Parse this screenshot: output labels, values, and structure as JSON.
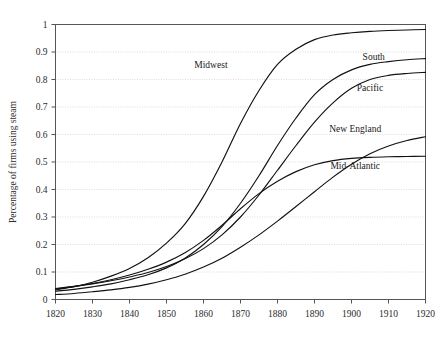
{
  "chart_data": {
    "type": "line",
    "title": "",
    "xlabel": "",
    "ylabel": "Percentage of firms using steam",
    "xlim": [
      1820,
      1920
    ],
    "ylim": [
      0,
      1
    ],
    "grid": true,
    "legend_position": "inline-labels",
    "x_ticks": [
      "1820",
      "1830",
      "1840",
      "1850",
      "1860",
      "1870",
      "1880",
      "1890",
      "1900",
      "1910",
      "1920"
    ],
    "y_ticks": [
      "0",
      "0.1",
      "0.2",
      "0.3",
      "0.4",
      "0.5",
      "0.6",
      "0.7",
      "0.8",
      "0.9",
      "1"
    ],
    "x": [
      1820,
      1825,
      1830,
      1835,
      1840,
      1845,
      1850,
      1855,
      1860,
      1865,
      1870,
      1875,
      1880,
      1885,
      1890,
      1895,
      1900,
      1905,
      1910,
      1915,
      1920
    ],
    "series": [
      {
        "name": "Midwest",
        "label": "Midwest",
        "label_x": 1862,
        "label_y": 0.855,
        "values": [
          0.035,
          0.047,
          0.063,
          0.085,
          0.113,
          0.152,
          0.205,
          0.275,
          0.375,
          0.5,
          0.64,
          0.76,
          0.855,
          0.91,
          0.945,
          0.962,
          0.97,
          0.975,
          0.978,
          0.98,
          0.982
        ]
      },
      {
        "name": "South",
        "label": "South",
        "label_x": 1906,
        "label_y": 0.885,
        "values": [
          0.03,
          0.037,
          0.046,
          0.057,
          0.072,
          0.09,
          0.115,
          0.15,
          0.2,
          0.265,
          0.35,
          0.45,
          0.56,
          0.66,
          0.745,
          0.8,
          0.835,
          0.855,
          0.865,
          0.872,
          0.876
        ]
      },
      {
        "name": "Pacific",
        "label": "Pacific",
        "label_x": 1905,
        "label_y": 0.77,
        "values": [
          0.04,
          0.048,
          0.057,
          0.068,
          0.082,
          0.098,
          0.12,
          0.148,
          0.185,
          0.235,
          0.3,
          0.38,
          0.47,
          0.56,
          0.645,
          0.715,
          0.768,
          0.8,
          0.815,
          0.822,
          0.826
        ]
      },
      {
        "name": "New England",
        "label": "New England",
        "label_x": 1901,
        "label_y": 0.62,
        "values": [
          0.018,
          0.022,
          0.028,
          0.035,
          0.044,
          0.056,
          0.072,
          0.092,
          0.118,
          0.15,
          0.19,
          0.235,
          0.285,
          0.338,
          0.392,
          0.445,
          0.492,
          0.53,
          0.558,
          0.578,
          0.592
        ]
      },
      {
        "name": "Mid-Atlantic",
        "label": "Mid-Atlantic",
        "label_x": 1901,
        "label_y": 0.487,
        "values": [
          0.038,
          0.047,
          0.058,
          0.072,
          0.089,
          0.11,
          0.136,
          0.17,
          0.215,
          0.27,
          0.33,
          0.385,
          0.43,
          0.465,
          0.49,
          0.505,
          0.513,
          0.517,
          0.519,
          0.52,
          0.521
        ]
      }
    ]
  }
}
